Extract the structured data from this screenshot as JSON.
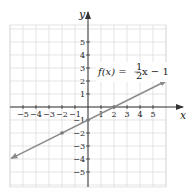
{
  "chart_data": {
    "type": "line",
    "title": "",
    "xlabel": "x",
    "ylabel": "y",
    "xlim": [
      -6,
      6
    ],
    "ylim": [
      -6,
      6
    ],
    "grid": true,
    "x_ticks": [
      -5,
      -4,
      -3,
      -2,
      -1,
      1,
      2,
      3,
      4,
      5
    ],
    "y_ticks": [
      -5,
      -4,
      -3,
      -2,
      -1,
      1,
      2,
      3,
      4,
      5
    ],
    "x_tick_labels": [
      "−5",
      "−4",
      "−3",
      "−2",
      "−1",
      "1",
      "2",
      "3",
      "4",
      "5"
    ],
    "y_tick_labels": [
      "5",
      "4",
      "3",
      "2",
      "1",
      "−1",
      "−2",
      "−3",
      "−4",
      "−5"
    ],
    "series": [
      {
        "name": "f(x) = 1/2 x − 1",
        "slope": 0.5,
        "intercept": -1,
        "x": [
          -5.9,
          6
        ],
        "y": [
          -3.95,
          2
        ],
        "color": "#8a8a8a",
        "arrows": "both"
      }
    ],
    "marked_points": [
      {
        "x": -2,
        "y": -2
      },
      {
        "x": 0,
        "y": -1
      },
      {
        "x": 2,
        "y": 0
      }
    ],
    "annotation": {
      "label_prefix": "f(x) = ",
      "fraction_num": "1",
      "fraction_den": "2",
      "label_suffix": "x − 1"
    }
  },
  "colors": {
    "grid": "#d9d9d9",
    "axis": "#333333",
    "line": "#8a8a8a",
    "point": "#7a7a7a"
  }
}
